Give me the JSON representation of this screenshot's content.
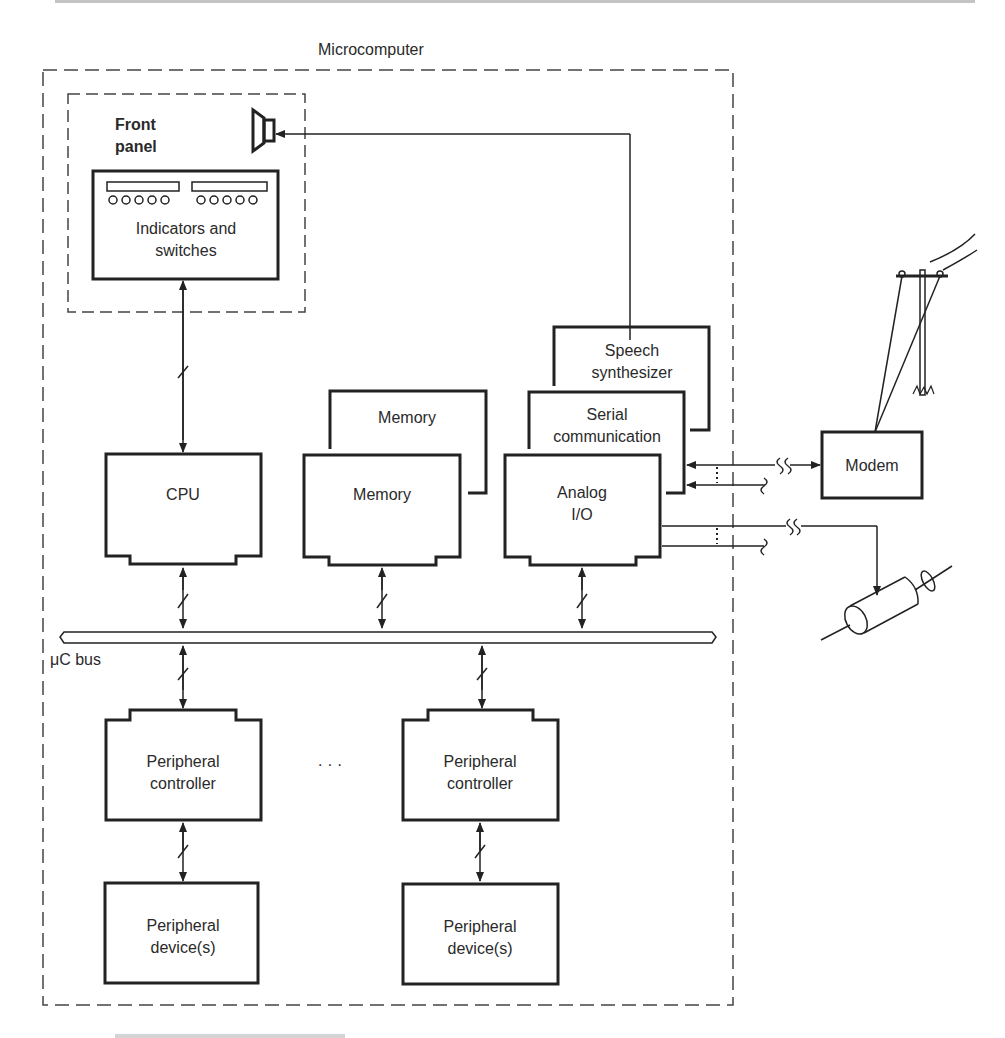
{
  "diagram": {
    "container_label": "Microcomputer",
    "front_panel": {
      "label_line1": "Front",
      "label_line2": "panel",
      "indicators_line1": "Indicators and",
      "indicators_line2": "switches"
    },
    "blocks": {
      "cpu": "CPU",
      "memory_back": "Memory",
      "memory_front": "Memory",
      "speech_line1": "Speech",
      "speech_line2": "synthesizer",
      "serial_line1": "Serial",
      "serial_line2": "communication",
      "analog_line1": "Analog",
      "analog_line2": "I/O",
      "modem": "Modem"
    },
    "bus_label": "μC bus",
    "peripherals": [
      {
        "controller_line1": "Peripheral",
        "controller_line2": "controller",
        "device_line1": "Peripheral",
        "device_line2": "device(s)"
      },
      {
        "controller_line1": "Peripheral",
        "controller_line2": "controller",
        "device_line1": "Peripheral",
        "device_line2": "device(s)"
      }
    ],
    "ellipsis": "· · ·",
    "external_icons": [
      "speaker-icon",
      "telephone-pole-icon",
      "motor-icon"
    ]
  }
}
